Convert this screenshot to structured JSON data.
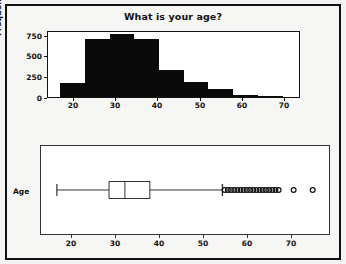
{
  "figure": {
    "title": "What is your age?",
    "background": "#f4f4f2",
    "frame_color": "#111111",
    "panels": [
      "histogram",
      "boxplot"
    ]
  },
  "histogram": {
    "title": "What is your age?",
    "ylabel": "Frequency",
    "y_ticks": [
      "0",
      "250",
      "500",
      "750"
    ],
    "x_ticks": [
      "20",
      "30",
      "40",
      "50",
      "60",
      "70"
    ],
    "bar_color": "#0a0a0a"
  },
  "boxplot": {
    "category_label": "Age",
    "x_ticks": [
      "20",
      "30",
      "40",
      "50",
      "60",
      "70"
    ],
    "line_color": "#333333"
  },
  "chart_data": [
    {
      "type": "bar",
      "id": "histogram-age",
      "title": "What is your age?",
      "xlabel": "",
      "ylabel": "Frequency",
      "xlim": [
        14.5,
        75.5
      ],
      "ylim": [
        0,
        830
      ],
      "y_ticks": [
        0,
        250,
        500,
        750
      ],
      "x_ticks": [
        20,
        30,
        40,
        50,
        60,
        70
      ],
      "grid": false,
      "legend": null,
      "bin_width": 6,
      "bin_edges": [
        17.5,
        23.5,
        29.5,
        35.5,
        41.5,
        47.5,
        53.5,
        59.5,
        65.5,
        71.5
      ],
      "categories": [
        "17.5-23.5",
        "23.5-29.5",
        "29.5-35.5",
        "35.5-41.5",
        "41.5-47.5",
        "47.5-53.5",
        "53.5-59.5",
        "59.5-65.5",
        "65.5-71.5"
      ],
      "values": [
        180,
        740,
        800,
        740,
        345,
        195,
        100,
        20,
        5
      ],
      "bar_color": "#0a0a0a"
    },
    {
      "type": "boxplot",
      "id": "boxplot-age",
      "title": "",
      "xlabel": "",
      "ylabel": "Age",
      "orientation": "horizontal",
      "xlim": [
        14.5,
        78
      ],
      "x_ticks": [
        20,
        30,
        40,
        50,
        60,
        70
      ],
      "grid": false,
      "legend": null,
      "categories": [
        "Age"
      ],
      "series": [
        {
          "name": "Age",
          "whisker_low": 18.0,
          "q1": 29.5,
          "median": 33.0,
          "q3": 38.5,
          "whisker_high": 54.5,
          "outliers": [
            55.0,
            55.7,
            56.4,
            57.1,
            57.8,
            58.5,
            59.2,
            59.9,
            60.6,
            61.3,
            62.0,
            62.7,
            63.4,
            64.1,
            64.8,
            65.5,
            66.2,
            66.9,
            70.2,
            74.4
          ]
        }
      ]
    }
  ]
}
